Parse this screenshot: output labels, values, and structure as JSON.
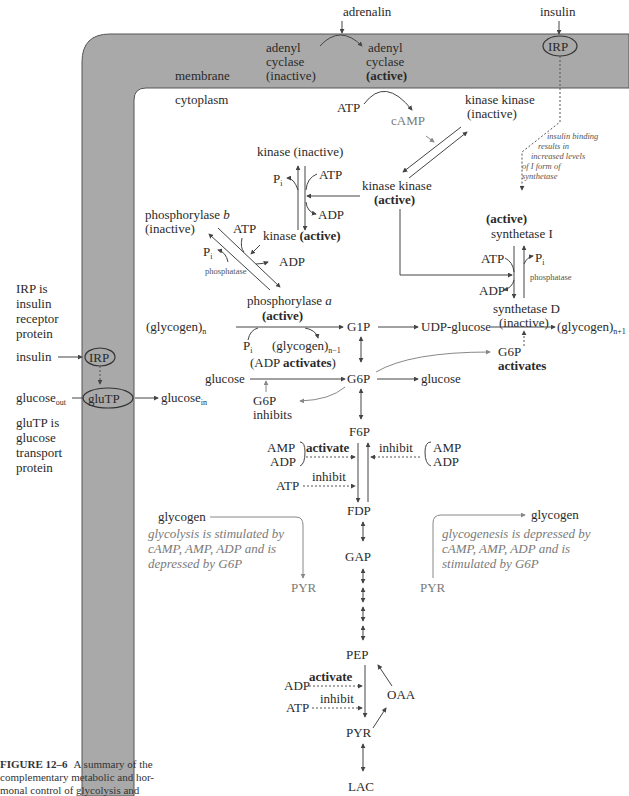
{
  "membrane": {
    "fill": "#a9a9a9",
    "label": "membrane",
    "cytoplasm_label": "cytoplasm"
  },
  "hormones": {
    "adrenalin": "adrenalin",
    "insulin_top": "insulin"
  },
  "adenyl_cyclase": {
    "inactive": [
      "adenyl",
      "cyclase",
      "(inactive)"
    ],
    "active": [
      "adenyl",
      "cyclase",
      "(active)"
    ]
  },
  "camp_cascade": {
    "atp": "ATP",
    "camp": "cAMP",
    "kinase_kinase_inactive": [
      "kinase kinase",
      "(inactive)"
    ],
    "kinase_kinase_active": [
      "kinase kinase",
      "(active)"
    ]
  },
  "irp_top": {
    "label": "IRP",
    "note": [
      "insulin binding",
      "results in",
      "increased levels",
      "of I form of",
      "synthetase"
    ]
  },
  "kinase": {
    "inactive": "kinase (inactive)",
    "pi": "P",
    "pi_sub": "i",
    "atp": "ATP",
    "adp": "ADP",
    "active_prefix": "kinase ",
    "active": "(active)"
  },
  "phosphorylase": {
    "b_label": "phosphorylase b",
    "b_state": "(inactive)",
    "atp": "ATP",
    "pi": "P",
    "pi_sub": "i",
    "phosphatase": "phosphatase",
    "adp": "ADP",
    "a_label": "phosphorylase a",
    "a_state": "(active)"
  },
  "synthetase": {
    "active": "(active)",
    "i_label": "synthetase I",
    "atp": "ATP",
    "pi": "P",
    "pi_sub": "i",
    "adp": "ADP",
    "phosphatase": "phosphatase",
    "d_label": "synthetase D",
    "d_state": "(inactive)"
  },
  "glycogen_row": {
    "glycogen_n": "(glycogen)",
    "glycogen_n_sub": "n",
    "pi": "P",
    "pi_sub": "i",
    "glycogen_n1": "(glycogen)",
    "glycogen_n1_sub": "n−1",
    "g1p": "G1P",
    "udp_glucose": "UDP-glucose",
    "glycogen_np1": "(glycogen)",
    "glycogen_np1_sub": "n+1"
  },
  "g6p_row": {
    "glucose_left": "glucose",
    "adp_activates": "(ADP activates)",
    "g6p": "G6P",
    "glucose_right": "glucose",
    "g6p_inhibits": [
      "G6P",
      "inhibits"
    ],
    "g6p_activates": [
      "G6P",
      "activates"
    ]
  },
  "glycolysis": {
    "f6p": "F6P",
    "amp": "AMP",
    "adp": "ADP",
    "activate": "activate",
    "inhibit": "inhibit",
    "atp": "ATP",
    "inhibit2": "inhibit",
    "amp_r": "AMP",
    "adp_r": "ADP",
    "fdp": "FDP",
    "gap": "GAP",
    "pep": "PEP",
    "adp2": "ADP",
    "activate2": "activate",
    "atp2": "ATP",
    "inhibit3": "inhibit",
    "oaa": "OAA",
    "pyr": "PYR",
    "lac": "LAC"
  },
  "glycolysis_box": {
    "glycogen": "glycogen",
    "text": [
      "glycolysis is stimulated by",
      "cAMP, AMP, ADP and is",
      "depressed by G6P"
    ],
    "pyr": "PYR"
  },
  "glycogenesis_box": {
    "glycogen": "glycogen",
    "text": [
      "glycogenesis is depressed by",
      "cAMP, AMP, ADP and is",
      "stimulated by G6P"
    ],
    "pyr": "PYR"
  },
  "left_panel": {
    "irp_note": [
      "IRP is",
      "insulin",
      "receptor",
      "protein"
    ],
    "insulin": "insulin",
    "irp": "IRP",
    "glucose_out": "glucose",
    "glucose_out_sub": "out",
    "glutp": "gluTP",
    "glucose_in": "glucose",
    "glucose_in_sub": "in",
    "glutp_note": [
      "gluTP is",
      "glucose",
      "transport",
      "protein"
    ]
  },
  "caption": {
    "label": "FIGURE 12–6",
    "lines": [
      "A summary of the",
      "complementary metabolic and hor-",
      "monal control of glycolysis and"
    ]
  }
}
